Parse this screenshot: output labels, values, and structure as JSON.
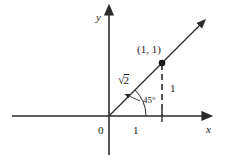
{
  "figure": {
    "kind": "coordinate-plane-diagram",
    "stroke_color": "#2b2b2b",
    "text_color": "#1a1a1a",
    "background_color": "#ffffff"
  },
  "axes": {
    "x_label": "x",
    "y_label": "y",
    "origin_label": "0"
  },
  "labels": {
    "point": "(1, 1)",
    "angle": "45°",
    "hypotenuse_radical_sign": "√",
    "hypotenuse_radicand": "2",
    "x_unit": "1",
    "y_unit": "1"
  },
  "geometry": {
    "origin_px": [
      109,
      116
    ],
    "point_px": [
      162,
      63
    ],
    "angle_degrees": 45,
    "x_unit_tick_px": 162
  }
}
